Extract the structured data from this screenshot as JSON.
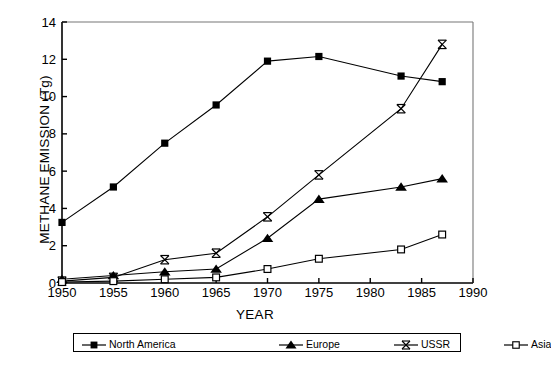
{
  "chart_data": {
    "type": "line",
    "title": "",
    "xlabel": "YEAR",
    "ylabel": "METHANE EMISSION (Tg)",
    "xlim": [
      1950,
      1990
    ],
    "ylim": [
      0,
      14
    ],
    "xticks": [
      1950,
      1955,
      1960,
      1965,
      1970,
      1975,
      1980,
      1985,
      1990
    ],
    "yticks": [
      0,
      2,
      4,
      6,
      8,
      10,
      12,
      14
    ],
    "grid": false,
    "legend_position": "below-axes",
    "series": [
      {
        "name": "North America",
        "marker": "filled-square",
        "x": [
          1950,
          1955,
          1960,
          1965,
          1970,
          1975,
          1983,
          1987
        ],
        "values": [
          3.25,
          5.15,
          7.5,
          9.55,
          11.9,
          12.15,
          11.1,
          10.8
        ]
      },
      {
        "name": "Europe",
        "marker": "filled-triangle",
        "x": [
          1950,
          1955,
          1960,
          1965,
          1970,
          1975,
          1983,
          1987
        ],
        "values": [
          0.2,
          0.4,
          0.6,
          0.75,
          2.4,
          4.5,
          5.15,
          5.6
        ]
      },
      {
        "name": "USSR",
        "marker": "cross-bar",
        "x": [
          1950,
          1955,
          1960,
          1965,
          1970,
          1975,
          1983,
          1987
        ],
        "values": [
          0.1,
          0.3,
          1.25,
          1.6,
          3.55,
          5.8,
          9.35,
          12.8
        ]
      },
      {
        "name": "Asia",
        "marker": "open-square",
        "x": [
          1950,
          1955,
          1960,
          1965,
          1970,
          1975,
          1983,
          1987
        ],
        "values": [
          0.05,
          0.1,
          0.2,
          0.3,
          0.75,
          1.3,
          1.8,
          2.6
        ]
      }
    ]
  },
  "legend": {
    "items": [
      {
        "label": "North America",
        "marker": "filled-square"
      },
      {
        "label": "Europe",
        "marker": "filled-triangle"
      },
      {
        "label": "USSR",
        "marker": "cross-bar"
      },
      {
        "label": "Asia",
        "marker": "open-square"
      }
    ]
  },
  "colors": {
    "axis": "#000000",
    "series": "#000000",
    "background": "#ffffff"
  }
}
